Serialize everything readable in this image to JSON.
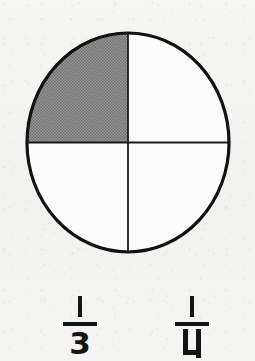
{
  "figure": {
    "name": "quadrant-circle",
    "shape": "circle",
    "total_parts": 4,
    "shaded_parts": 1,
    "shaded_quadrant": "top-left",
    "outline_color": "#111111",
    "divider_color": "#1c1c1c",
    "shade_color": "#8a8a8a",
    "unshaded_color": "#fbfbfb",
    "background_color": "#f3f3f2"
  },
  "answers": {
    "options": [
      {
        "id": "option-left",
        "numerator": "1",
        "denominator": "3",
        "text": "1/3"
      },
      {
        "id": "option-right",
        "numerator": "1",
        "denominator": "4",
        "text": "1/4"
      }
    ]
  }
}
